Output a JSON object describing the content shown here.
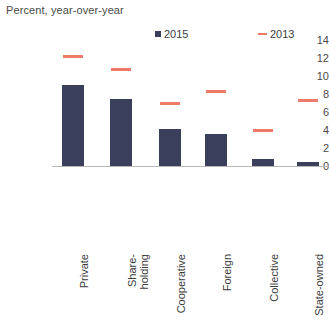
{
  "chart_data": {
    "type": "bar",
    "title": "Percent, year-over-year",
    "xlabel": "",
    "ylabel": "",
    "ylim": [
      0,
      14
    ],
    "yticks": [
      14,
      12,
      10,
      8,
      6,
      4,
      2,
      0
    ],
    "grid": false,
    "legend_position": "top-right",
    "categories": [
      "Private",
      "Share-\nholding",
      "Cooperative",
      "Foreign",
      "Collective",
      "State-owned"
    ],
    "series": [
      {
        "name": "2015",
        "type": "bar",
        "color": "#3a3f5c",
        "values": [
          9.0,
          7.4,
          4.1,
          3.6,
          0.8,
          0.4
        ]
      },
      {
        "name": "2013",
        "type": "dash-marker",
        "color": "#f07a6a",
        "values": [
          12.2,
          10.7,
          6.9,
          8.3,
          3.9,
          7.3
        ]
      }
    ]
  },
  "legend": {
    "entries": [
      {
        "label": "2015",
        "marker": "square-swatch"
      },
      {
        "label": "2013",
        "marker": "dash-swatch"
      }
    ]
  },
  "axis": {
    "y_tick_labels": [
      "14",
      "12",
      "10",
      "8",
      "6",
      "4",
      "2",
      "0"
    ]
  },
  "colors": {
    "bar": "#3a3f5c",
    "marker": "#f07a6a",
    "axis": "#b8b8b8",
    "text": "#3c3c3c"
  }
}
